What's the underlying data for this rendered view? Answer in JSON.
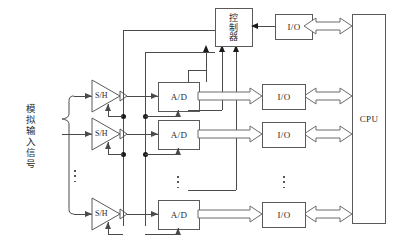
{
  "diagram": {
    "width": 406,
    "height": 241,
    "line_color": "#4a4a4a",
    "text_color": "#2a2a2a"
  },
  "input_label": {
    "text": "模拟输入信号",
    "meaning": "analog input signals"
  },
  "controller": {
    "label": "控制器",
    "meaning": "controller"
  },
  "cpu": {
    "label": "CPU"
  },
  "channels": [
    {
      "sh": "S/H",
      "adc": "A/D",
      "io": "I/O"
    },
    {
      "sh": "S/H",
      "adc": "A/D",
      "io": "I/O"
    },
    {
      "sh": "S/H",
      "adc": "A/D",
      "io": "I/O"
    }
  ],
  "top_io": {
    "label": "I/O"
  },
  "ellipsis": {
    "input_column": "⋮",
    "adc_column": "⋮",
    "io_column": "⋮"
  }
}
